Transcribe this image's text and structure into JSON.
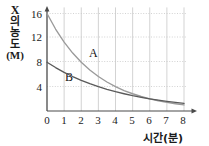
{
  "chart_data": {
    "type": "line",
    "title": "",
    "xlabel": "시간(분)",
    "ylabel": "X의 농도 (M)",
    "ylabel_parts": [
      "X",
      "의",
      "농",
      "도",
      "(M)"
    ],
    "xlim": [
      0,
      8
    ],
    "ylim": [
      0,
      17
    ],
    "xticks": [
      "0",
      "1",
      "2",
      "3",
      "4",
      "5",
      "6",
      "7",
      "8"
    ],
    "yticks": [
      "4",
      "8",
      "12",
      "16"
    ],
    "grid": "both-dotted",
    "legend": "inline-labels",
    "x": [
      0,
      0.5,
      1,
      1.5,
      2,
      2.5,
      3,
      3.5,
      4,
      4.5,
      5,
      5.5,
      6,
      6.5,
      7,
      7.5,
      8
    ],
    "series": [
      {
        "name": "A",
        "color": "#9a9a9a",
        "label_x": 2.55,
        "label_y": 9.4,
        "values": [
          16,
          13.45,
          11.31,
          9.51,
          8.0,
          6.73,
          5.66,
          4.76,
          4.0,
          3.36,
          2.83,
          2.38,
          2.0,
          1.68,
          1.41,
          1.19,
          1.0
        ]
      },
      {
        "name": "B",
        "color": "#5a5a5a",
        "label_x": 1.25,
        "label_y": 6.1,
        "values": [
          8,
          7.13,
          6.35,
          5.66,
          5.04,
          4.49,
          4.0,
          3.56,
          3.17,
          2.83,
          2.52,
          2.25,
          2.0,
          1.78,
          1.59,
          1.41,
          1.26
        ]
      }
    ],
    "annotations": [
      "A",
      "B"
    ]
  },
  "axis": {
    "y_label_x": "X",
    "y_label_ui": "의",
    "y_label_nong": "농",
    "y_label_do": "도",
    "y_label_unit": "(M)",
    "x_label": "시간(분)"
  },
  "ticks": {
    "y": [
      {
        "text": "16"
      },
      {
        "text": "12"
      },
      {
        "text": "8"
      },
      {
        "text": "4"
      }
    ],
    "x": [
      {
        "text": "0"
      },
      {
        "text": "1"
      },
      {
        "text": "2"
      },
      {
        "text": "3"
      },
      {
        "text": "4"
      },
      {
        "text": "5"
      },
      {
        "text": "6"
      },
      {
        "text": "7"
      },
      {
        "text": "8"
      }
    ]
  },
  "labels": {
    "curve_a": "A",
    "curve_b": "B"
  },
  "colors": {
    "axis": "#4a4a4a",
    "grid": "#c8c8c8",
    "curve_a": "#9a9a9a",
    "curve_b": "#5a5a5a",
    "text": "#1a1a1a",
    "background": "#ffffff"
  }
}
